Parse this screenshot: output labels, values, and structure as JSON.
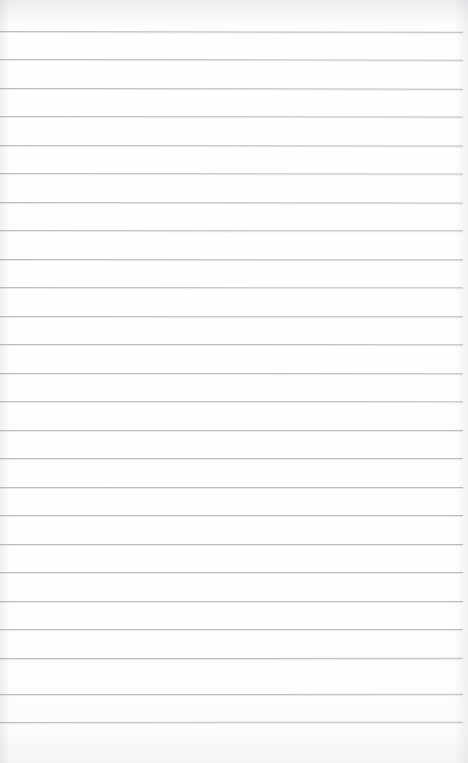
{
  "document": {
    "kind": "scanned-lined-paper",
    "title": "Blank Lined Notebook Page",
    "page_width": 468,
    "page_height": 763,
    "paper_color": "#ffffff",
    "rule_color": "#b5b9bd",
    "rule_count": 25,
    "first_rule_y": 31,
    "rule_spacing": 28.35,
    "rule_left_x": 0,
    "rule_right_x": 463,
    "rule_thickness": 1,
    "margin_rule": false,
    "handwriting": "",
    "body_text": "",
    "header_text": "",
    "footer_text": "",
    "page_number": ""
  },
  "rules": [
    {
      "y": 31,
      "x": 0,
      "w": 463,
      "tilt": 0.1,
      "opacity": 0.95
    },
    {
      "y": 59,
      "x": 0,
      "w": 463,
      "tilt": 0.08,
      "opacity": 0.92
    },
    {
      "y": 88,
      "x": 0,
      "w": 463,
      "tilt": 0.08,
      "opacity": 0.94
    },
    {
      "y": 116,
      "x": 0,
      "w": 463,
      "tilt": 0.06,
      "opacity": 0.9
    },
    {
      "y": 145,
      "x": 0,
      "w": 463,
      "tilt": 0.06,
      "opacity": 0.93
    },
    {
      "y": 173,
      "x": 0,
      "w": 463,
      "tilt": 0.05,
      "opacity": 0.91
    },
    {
      "y": 202,
      "x": 0,
      "w": 463,
      "tilt": 0.05,
      "opacity": 0.94
    },
    {
      "y": 230,
      "x": 0,
      "w": 463,
      "tilt": 0.04,
      "opacity": 0.92
    },
    {
      "y": 259,
      "x": 0,
      "w": 463,
      "tilt": 0.04,
      "opacity": 0.95
    },
    {
      "y": 287,
      "x": 0,
      "w": 463,
      "tilt": 0.03,
      "opacity": 0.91
    },
    {
      "y": 316,
      "x": 0,
      "w": 463,
      "tilt": 0.03,
      "opacity": 0.93
    },
    {
      "y": 344,
      "x": 0,
      "w": 463,
      "tilt": 0.02,
      "opacity": 0.92
    },
    {
      "y": 373,
      "x": 0,
      "w": 463,
      "tilt": 0.02,
      "opacity": 0.94
    },
    {
      "y": 401,
      "x": 0,
      "w": 463,
      "tilt": 0.02,
      "opacity": 0.9
    },
    {
      "y": 430,
      "x": 0,
      "w": 463,
      "tilt": 0.01,
      "opacity": 0.93
    },
    {
      "y": 458,
      "x": 0,
      "w": 463,
      "tilt": 0.01,
      "opacity": 0.91
    },
    {
      "y": 487,
      "x": 0,
      "w": 463,
      "tilt": 0.01,
      "opacity": 0.94
    },
    {
      "y": 515,
      "x": 0,
      "w": 463,
      "tilt": 0.0,
      "opacity": 0.92
    },
    {
      "y": 544,
      "x": 0,
      "w": 463,
      "tilt": 0.0,
      "opacity": 0.93
    },
    {
      "y": 572,
      "x": 0,
      "w": 463,
      "tilt": 0.0,
      "opacity": 0.91
    },
    {
      "y": 601,
      "x": 0,
      "w": 463,
      "tilt": -0.01,
      "opacity": 0.94
    },
    {
      "y": 629,
      "x": 0,
      "w": 463,
      "tilt": -0.01,
      "opacity": 0.9
    },
    {
      "y": 658,
      "x": 0,
      "w": 463,
      "tilt": -0.02,
      "opacity": 0.93
    },
    {
      "y": 694,
      "x": 0,
      "w": 463,
      "tilt": -0.02,
      "opacity": 0.92
    },
    {
      "y": 722,
      "x": 0,
      "w": 463,
      "tilt": -0.03,
      "opacity": 0.9
    }
  ],
  "speckles": [
    {
      "x": 62,
      "y": 18,
      "d": 1
    },
    {
      "x": 151,
      "y": 9,
      "d": 1
    },
    {
      "x": 297,
      "y": 22,
      "d": 1
    },
    {
      "x": 402,
      "y": 12,
      "d": 1
    },
    {
      "x": 33,
      "y": 204,
      "d": 1
    },
    {
      "x": 216,
      "y": 338,
      "d": 1
    },
    {
      "x": 354,
      "y": 376,
      "d": 1
    },
    {
      "x": 110,
      "y": 481,
      "d": 1
    },
    {
      "x": 281,
      "y": 545,
      "d": 1
    },
    {
      "x": 428,
      "y": 612,
      "d": 1
    },
    {
      "x": 75,
      "y": 688,
      "d": 1
    },
    {
      "x": 333,
      "y": 744,
      "d": 1
    }
  ]
}
